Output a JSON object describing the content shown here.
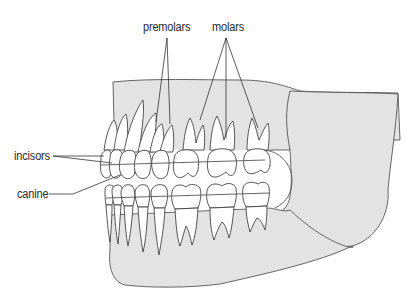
{
  "diagram": {
    "labels": {
      "premolars": "premolars",
      "molars": "molars",
      "incisors": "incisors",
      "canine": "canine"
    },
    "colors": {
      "bone_fill": "#e3e3e3",
      "outline": "#444444",
      "tooth_fill": "#ffffff",
      "text": "#2a2a2a"
    }
  }
}
